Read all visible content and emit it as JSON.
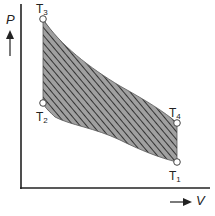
{
  "diagram": {
    "type": "P-V cycle diagram",
    "axes": {
      "y_label": "P",
      "x_label": "V"
    },
    "points": [
      {
        "name": "T",
        "sub": "3"
      },
      {
        "name": "T",
        "sub": "2"
      },
      {
        "name": "T",
        "sub": "4"
      },
      {
        "name": "T",
        "sub": "1"
      }
    ],
    "colors": {
      "axis": "#222222",
      "fill": "#9a9a9a",
      "hatch": "#333333",
      "point": "#ffffff"
    }
  }
}
